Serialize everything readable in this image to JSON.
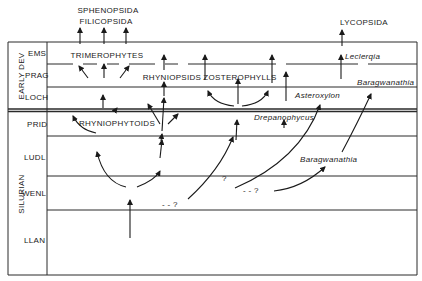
{
  "periods": [
    {
      "label": "EARLY DEV",
      "stages": [
        "EMS",
        "PRAG",
        "LOCH"
      ]
    },
    {
      "label": "SILURIAN",
      "stages": [
        "PRID",
        "LUDL",
        "WENL",
        "LLAN"
      ]
    }
  ],
  "top_groups": {
    "left_line1": "SPHENOPSIDA",
    "left_line2": "FILICOPSIDA",
    "right": "LYCOPSIDA"
  },
  "groups": {
    "trimerophytes": "TRIMEROPHYTES",
    "rhyniopsids": "RHYNIOPSIDS",
    "zosterophylls": "ZOSTEROPHYLLS",
    "rhyniophytoids": "RHYNIOPHYTOIDS"
  },
  "taxa": {
    "leclercqia": "Leclerqia",
    "baragwanathia_upper": "Baragwanathia",
    "asteroxylon": "Asteroxylon",
    "drepanophycus": "Drepanophycus",
    "baragwanathia_lower": "Baragwanathia"
  },
  "uncertain_marks": {
    "q1": "- - ?",
    "q2": "?",
    "q3": "- - ?"
  }
}
